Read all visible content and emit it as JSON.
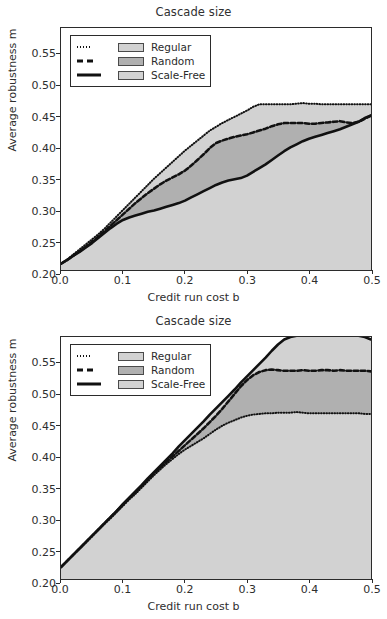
{
  "figure": {
    "width": 387,
    "height": 619,
    "background": "#ffffff"
  },
  "style": {
    "axis_color": "#2b2b2b",
    "text_color": "#2e2e2e",
    "title_color": "#303030",
    "fill_regular": "#d2d2d2",
    "fill_random": "#b0b0b0",
    "fill_scalefree": "#d2d2d2",
    "line_color": "#111111"
  },
  "panels": [
    {
      "id": "top",
      "title": "Cascade size",
      "xlabel": "Credit run cost b",
      "ylabel": "Average robustness m",
      "xticks": [
        "0.0",
        "0.1",
        "0.2",
        "0.3",
        "0.4",
        "0.5"
      ],
      "yticks": [
        "0.20",
        "0.25",
        "0.30",
        "0.35",
        "0.40",
        "0.45",
        "0.50",
        "0.55"
      ],
      "legend": [
        {
          "style": "dotted",
          "label": "Regular",
          "patch": "#d2d2d2"
        },
        {
          "style": "dashed",
          "label": "Random",
          "patch": "#b0b0b0"
        },
        {
          "style": "solid",
          "label": "Scale-Free",
          "patch": "#d2d2d2"
        }
      ]
    },
    {
      "id": "bottom",
      "title": "Cascade size",
      "xlabel": "Credit run cost b",
      "ylabel": "Average robustness m",
      "xticks": [
        "0.0",
        "0.1",
        "0.2",
        "0.3",
        "0.4",
        "0.5"
      ],
      "yticks": [
        "0.20",
        "0.25",
        "0.30",
        "0.35",
        "0.40",
        "0.45",
        "0.50",
        "0.55"
      ],
      "legend": [
        {
          "style": "dotted",
          "label": "Regular",
          "patch": "#d2d2d2"
        },
        {
          "style": "dashed",
          "label": "Random",
          "patch": "#b0b0b0"
        },
        {
          "style": "solid",
          "label": "Scale-Free",
          "patch": "#d2d2d2"
        }
      ]
    }
  ],
  "chart_data": [
    {
      "type": "area",
      "panel": "top",
      "title": "Cascade size",
      "xlabel": "Credit run cost b",
      "ylabel": "Average robustness m",
      "xlim": [
        0.0,
        0.5
      ],
      "ylim": [
        0.205,
        0.592
      ],
      "grid": false,
      "legend_position": "upper-left",
      "x": [
        0.0,
        0.01,
        0.02,
        0.03,
        0.04,
        0.05,
        0.06,
        0.07,
        0.08,
        0.09,
        0.1,
        0.11,
        0.12,
        0.13,
        0.14,
        0.15,
        0.16,
        0.17,
        0.18,
        0.19,
        0.2,
        0.21,
        0.22,
        0.23,
        0.24,
        0.25,
        0.26,
        0.27,
        0.28,
        0.29,
        0.3,
        0.31,
        0.32,
        0.33,
        0.34,
        0.35,
        0.36,
        0.37,
        0.38,
        0.39,
        0.4,
        0.41,
        0.42,
        0.43,
        0.44,
        0.45,
        0.46,
        0.47,
        0.48,
        0.49,
        0.5
      ],
      "series": [
        {
          "name": "Regular",
          "style": "dotted",
          "values": [
            0.215,
            0.222,
            0.23,
            0.238,
            0.246,
            0.254,
            0.262,
            0.271,
            0.281,
            0.291,
            0.301,
            0.311,
            0.321,
            0.331,
            0.341,
            0.351,
            0.36,
            0.369,
            0.378,
            0.387,
            0.396,
            0.404,
            0.412,
            0.42,
            0.428,
            0.434,
            0.44,
            0.445,
            0.45,
            0.455,
            0.46,
            0.466,
            0.47,
            0.47,
            0.47,
            0.47,
            0.47,
            0.47,
            0.471,
            0.472,
            0.471,
            0.471,
            0.47,
            0.47,
            0.47,
            0.47,
            0.47,
            0.47,
            0.47,
            0.47,
            0.47
          ]
        },
        {
          "name": "Random",
          "style": "dashed",
          "values": [
            0.215,
            0.221,
            0.228,
            0.235,
            0.242,
            0.25,
            0.258,
            0.267,
            0.276,
            0.285,
            0.294,
            0.303,
            0.312,
            0.32,
            0.328,
            0.335,
            0.342,
            0.348,
            0.353,
            0.358,
            0.364,
            0.372,
            0.381,
            0.39,
            0.4,
            0.408,
            0.412,
            0.415,
            0.418,
            0.42,
            0.422,
            0.425,
            0.428,
            0.431,
            0.435,
            0.438,
            0.44,
            0.44,
            0.44,
            0.44,
            0.439,
            0.439,
            0.44,
            0.441,
            0.442,
            0.443,
            0.441,
            0.44,
            0.442,
            0.447,
            0.452
          ]
        },
        {
          "name": "Scale-Free",
          "style": "solid",
          "values": [
            0.215,
            0.221,
            0.228,
            0.234,
            0.241,
            0.248,
            0.256,
            0.264,
            0.272,
            0.279,
            0.285,
            0.289,
            0.292,
            0.295,
            0.298,
            0.3,
            0.303,
            0.306,
            0.309,
            0.312,
            0.316,
            0.321,
            0.326,
            0.331,
            0.336,
            0.341,
            0.345,
            0.348,
            0.35,
            0.352,
            0.356,
            0.362,
            0.368,
            0.374,
            0.381,
            0.388,
            0.395,
            0.401,
            0.406,
            0.411,
            0.415,
            0.418,
            0.421,
            0.424,
            0.427,
            0.43,
            0.434,
            0.438,
            0.442,
            0.448,
            0.452
          ]
        }
      ]
    },
    {
      "type": "area",
      "panel": "bottom",
      "title": "Cascade size",
      "xlabel": "Credit run cost b",
      "ylabel": "Average robustness m",
      "xlim": [
        0.0,
        0.5
      ],
      "ylim": [
        0.205,
        0.592
      ],
      "grid": false,
      "legend_position": "upper-left",
      "x": [
        0.0,
        0.01,
        0.02,
        0.03,
        0.04,
        0.05,
        0.06,
        0.07,
        0.08,
        0.09,
        0.1,
        0.11,
        0.12,
        0.13,
        0.14,
        0.15,
        0.16,
        0.17,
        0.18,
        0.19,
        0.2,
        0.21,
        0.22,
        0.23,
        0.24,
        0.25,
        0.26,
        0.27,
        0.28,
        0.29,
        0.3,
        0.31,
        0.32,
        0.33,
        0.34,
        0.35,
        0.36,
        0.37,
        0.38,
        0.39,
        0.4,
        0.41,
        0.42,
        0.43,
        0.44,
        0.45,
        0.46,
        0.47,
        0.48,
        0.49,
        0.5
      ],
      "series": [
        {
          "name": "Regular",
          "style": "dotted",
          "values": [
            0.224,
            0.234,
            0.244,
            0.253,
            0.263,
            0.273,
            0.283,
            0.293,
            0.302,
            0.312,
            0.322,
            0.332,
            0.341,
            0.351,
            0.361,
            0.371,
            0.38,
            0.389,
            0.397,
            0.405,
            0.412,
            0.418,
            0.424,
            0.43,
            0.437,
            0.444,
            0.45,
            0.455,
            0.459,
            0.463,
            0.466,
            0.468,
            0.469,
            0.47,
            0.47,
            0.471,
            0.471,
            0.471,
            0.472,
            0.471,
            0.47,
            0.47,
            0.47,
            0.47,
            0.47,
            0.47,
            0.47,
            0.47,
            0.47,
            0.469,
            0.469
          ]
        },
        {
          "name": "Random",
          "style": "dashed",
          "values": [
            0.224,
            0.234,
            0.244,
            0.254,
            0.264,
            0.274,
            0.284,
            0.294,
            0.304,
            0.314,
            0.324,
            0.334,
            0.344,
            0.354,
            0.364,
            0.374,
            0.383,
            0.392,
            0.401,
            0.41,
            0.419,
            0.428,
            0.437,
            0.446,
            0.456,
            0.466,
            0.477,
            0.489,
            0.501,
            0.513,
            0.523,
            0.531,
            0.536,
            0.539,
            0.54,
            0.539,
            0.538,
            0.538,
            0.538,
            0.539,
            0.538,
            0.538,
            0.539,
            0.539,
            0.538,
            0.539,
            0.538,
            0.538,
            0.538,
            0.538,
            0.537
          ]
        },
        {
          "name": "Scale-Free",
          "style": "solid",
          "values": [
            0.224,
            0.234,
            0.244,
            0.254,
            0.264,
            0.274,
            0.284,
            0.294,
            0.304,
            0.314,
            0.325,
            0.335,
            0.345,
            0.355,
            0.366,
            0.376,
            0.386,
            0.396,
            0.406,
            0.417,
            0.427,
            0.437,
            0.447,
            0.457,
            0.468,
            0.478,
            0.488,
            0.498,
            0.508,
            0.519,
            0.529,
            0.539,
            0.549,
            0.559,
            0.57,
            0.58,
            0.588,
            0.592,
            0.594,
            0.594,
            0.594,
            0.594,
            0.594,
            0.594,
            0.594,
            0.594,
            0.594,
            0.594,
            0.594,
            0.592,
            0.588
          ]
        }
      ]
    }
  ]
}
